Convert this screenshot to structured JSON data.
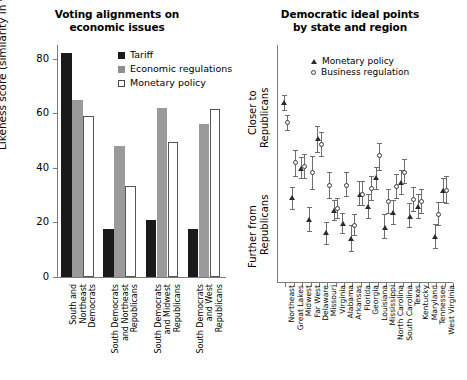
{
  "figure": {
    "left_panel": {
      "title_line1": "Voting alignments on",
      "title_line2": "economic issues",
      "ylabel": "Likeness score (similarity in voting)",
      "legend": [
        {
          "key": "tariff",
          "label": "Tariff"
        },
        {
          "key": "econ",
          "label": "Economic regulations"
        },
        {
          "key": "monetary",
          "label": "Monetary policy"
        }
      ]
    },
    "right_panel": {
      "title_line1": "Democratic ideal points",
      "title_line2": "by state and region",
      "ylabel_top_line1": "Closer to",
      "ylabel_top_line2": "Republicans",
      "ylabel_bottom_line1": "Further from",
      "ylabel_bottom_line2": "Republicans",
      "legend": [
        {
          "key": "monetary",
          "label": "Monetary policy"
        },
        {
          "key": "business",
          "label": "Business regulation"
        }
      ]
    }
  },
  "chart_data": [
    {
      "type": "bar",
      "title": "Voting alignments on economic issues",
      "xlabel": "",
      "ylabel": "Likeness score (similarity in voting)",
      "ylim": [
        0,
        85
      ],
      "yticks": [
        0,
        20,
        40,
        60,
        80
      ],
      "grid": false,
      "legend_position": "top-right",
      "categories": [
        "South and Northeast Democrats",
        "South Democrats and Northeast Republicans",
        "South Democrats and Midwest Republicans",
        "South Democrats and West Republicans"
      ],
      "categories_wrapped": [
        [
          "South and",
          "Northeast",
          "Democrats"
        ],
        [
          "South Democrats",
          "and Northeast",
          "Republicans"
        ],
        [
          "South Democrats",
          "and Midwest",
          "Republicans"
        ],
        [
          "South Democrats",
          "and West",
          "Republicans"
        ]
      ],
      "series": [
        {
          "name": "Tariff",
          "color": "#1a1a1a",
          "values": [
            82,
            17.5,
            21,
            17.7
          ]
        },
        {
          "name": "Economic regulations",
          "color": "#9a9a9a",
          "values": [
            65,
            48,
            62,
            56
          ]
        },
        {
          "name": "Monetary policy",
          "color": "#ffffff",
          "values": [
            59,
            33.5,
            49.5,
            61.5
          ]
        }
      ]
    },
    {
      "type": "scatter",
      "title": "Democratic ideal points by state and region",
      "xlabel": "",
      "ylabel": "Ideal point (Closer to Republicans → Further from Republicans)",
      "ylim": [
        0,
        100
      ],
      "grid": false,
      "legend_position": "top-left",
      "note": "y values given on a 0-100 scale where 100 = closest to Republicans (top of axis) and 0 = furthest from Republicans (bottom). Error bars are 95% confidence intervals.",
      "categories": [
        "Northeast",
        "Great Lakes",
        "Midwest",
        "Far West",
        "Delaware",
        "Missouri",
        "Virginia",
        "Alabama",
        "Arkansas",
        "Florida",
        "Georgia",
        "Louisiana",
        "Mississippi",
        "North Carolina",
        "South Carolina",
        "Texas",
        "Kentucky",
        "Maryland",
        "Tennessee",
        "West Virginia"
      ],
      "series": [
        {
          "name": "Monetary policy",
          "marker": "triangle",
          "color": "#2b2b2b",
          "values": [
            95,
            43,
            59,
            31,
            75,
            24,
            36,
            29,
            21,
            45,
            38,
            54,
            27,
            35,
            51,
            33,
            38,
            null,
            22,
            47
          ],
          "err_low": [
            91,
            37,
            54,
            25,
            68,
            18,
            31,
            24,
            14,
            39,
            32,
            48,
            21,
            29,
            45,
            27,
            32,
            null,
            16,
            41
          ],
          "err_high": [
            99,
            49,
            65,
            38,
            82,
            30,
            42,
            35,
            28,
            52,
            45,
            60,
            34,
            42,
            58,
            40,
            45,
            null,
            29,
            54
          ]
        },
        {
          "name": "Business regulation",
          "marker": "circle",
          "color": "#ffffff",
          "values": [
            84,
            62,
            60,
            57,
            72,
            50,
            37,
            50,
            28,
            45,
            48,
            66,
            41,
            49,
            57,
            42,
            41,
            null,
            34,
            47
          ],
          "err_low": [
            80,
            55,
            54,
            48,
            66,
            43,
            32,
            44,
            23,
            39,
            42,
            58,
            35,
            43,
            51,
            36,
            35,
            null,
            28,
            40
          ],
          "err_high": [
            88,
            69,
            67,
            66,
            79,
            57,
            43,
            57,
            34,
            52,
            55,
            73,
            48,
            56,
            64,
            49,
            48,
            null,
            41,
            55
          ]
        }
      ]
    }
  ]
}
